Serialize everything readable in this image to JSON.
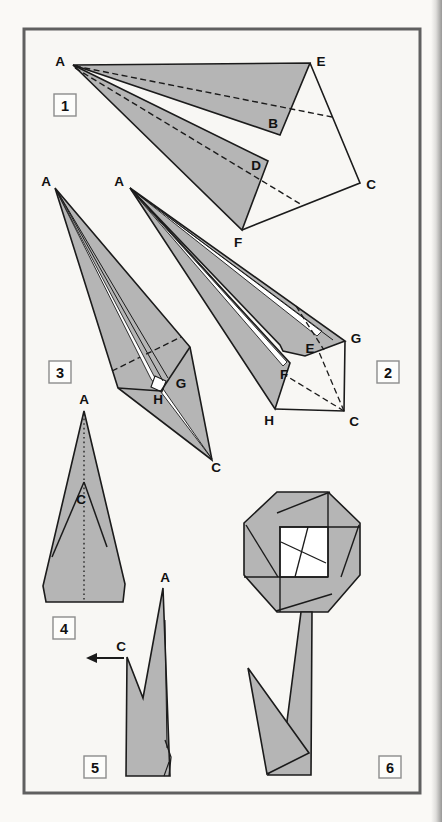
{
  "document": {
    "kind": "origami-instruction-page",
    "subject": "origami flower folding steps"
  },
  "colors": {
    "paper": "#faf9f6",
    "panel": "#f8f7f4",
    "frame": "#606060",
    "fill": "#b5b5b5",
    "line": "#1b1b1b",
    "box_border": "#8c8c8c",
    "box_fill": "#fdfdfb",
    "label": "#111111"
  },
  "frame": {
    "x": 24,
    "y": 29,
    "w": 396,
    "h": 764
  },
  "step_boxes": [
    {
      "n": "1",
      "x": 54,
      "y": 94
    },
    {
      "n": "2",
      "x": 377,
      "y": 361
    },
    {
      "n": "3",
      "x": 49,
      "y": 361
    },
    {
      "n": "4",
      "x": 53,
      "y": 617
    },
    {
      "n": "5",
      "x": 84,
      "y": 756
    },
    {
      "n": "6",
      "x": 379,
      "y": 756
    }
  ],
  "labels": [
    {
      "step": 1,
      "text": "A",
      "x": 60,
      "y": 61
    },
    {
      "step": 1,
      "text": "E",
      "x": 321,
      "y": 61
    },
    {
      "step": 1,
      "text": "B",
      "x": 273,
      "y": 123
    },
    {
      "step": 1,
      "text": "D",
      "x": 256,
      "y": 165
    },
    {
      "step": 1,
      "text": "C",
      "x": 371,
      "y": 184
    },
    {
      "step": 1,
      "text": "F",
      "x": 238,
      "y": 242
    },
    {
      "step": 2,
      "text": "A",
      "x": 119,
      "y": 181
    },
    {
      "step": 2,
      "text": "G",
      "x": 356,
      "y": 338
    },
    {
      "step": 2,
      "text": "E",
      "x": 310,
      "y": 348
    },
    {
      "step": 2,
      "text": "F",
      "x": 284,
      "y": 374
    },
    {
      "step": 2,
      "text": "H",
      "x": 269,
      "y": 420
    },
    {
      "step": 2,
      "text": "C",
      "x": 354,
      "y": 421
    },
    {
      "step": 3,
      "text": "A",
      "x": 46,
      "y": 181
    },
    {
      "step": 3,
      "text": "G",
      "x": 181,
      "y": 383
    },
    {
      "step": 3,
      "text": "H",
      "x": 158,
      "y": 399
    },
    {
      "step": 3,
      "text": "C",
      "x": 216,
      "y": 467
    },
    {
      "step": 4,
      "text": "A",
      "x": 84,
      "y": 399
    },
    {
      "step": 4,
      "text": "C",
      "x": 81,
      "y": 499
    },
    {
      "step": 5,
      "text": "A",
      "x": 165,
      "y": 577
    },
    {
      "step": 5,
      "text": "C",
      "x": 121,
      "y": 646
    }
  ],
  "shapes": [
    {
      "name": "step1-outline",
      "type": "polyline",
      "pts": [
        [
          310,
          63
        ],
        [
          360,
          183
        ],
        [
          242,
          230
        ]
      ],
      "fill": "none"
    },
    {
      "name": "step1-flap-upper",
      "type": "polygon",
      "pts": [
        [
          73,
          65
        ],
        [
          310,
          63
        ],
        [
          280,
          135
        ]
      ],
      "fill": "gray"
    },
    {
      "name": "step1-flap-lower",
      "type": "polygon",
      "pts": [
        [
          73,
          65
        ],
        [
          268,
          161
        ],
        [
          242,
          230
        ]
      ],
      "fill": "gray"
    },
    {
      "name": "step1-foldline-AB",
      "type": "line",
      "pts": [
        [
          75,
          66
        ],
        [
          332,
          117
        ]
      ],
      "dash": "dashed",
      "sw": 1.4
    },
    {
      "name": "step1-foldline-AD",
      "type": "line",
      "pts": [
        [
          75,
          68
        ],
        [
          302,
          205
        ]
      ],
      "dash": "dashed",
      "sw": 1.4
    },
    {
      "name": "step2-outline",
      "type": "polyline",
      "pts": [
        [
          345,
          341
        ],
        [
          344,
          411
        ],
        [
          275,
          409
        ]
      ],
      "fill": "none"
    },
    {
      "name": "step2-foldline-CE",
      "type": "line",
      "pts": [
        [
          344,
          411
        ],
        [
          302,
          312
        ]
      ],
      "dash": "dashed",
      "sw": 1.3
    },
    {
      "name": "step2-foldline-CF",
      "type": "line",
      "pts": [
        [
          344,
          411
        ],
        [
          280,
          372
        ]
      ],
      "dash": "dashed",
      "sw": 1.3
    },
    {
      "name": "step2-spike-upper",
      "type": "polygon",
      "pts": [
        [
          130,
          188
        ],
        [
          345,
          341
        ],
        [
          305,
          356
        ],
        [
          283,
          351
        ],
        [
          280,
          345
        ]
      ],
      "fill": "gray"
    },
    {
      "name": "step2-spike-lower",
      "type": "polygon",
      "pts": [
        [
          130,
          188
        ],
        [
          290,
          363
        ],
        [
          275,
          409
        ]
      ],
      "fill": "gray"
    },
    {
      "name": "step2-slit-upper",
      "type": "polygon",
      "pts": [
        [
          131,
          189
        ],
        [
          322,
          331
        ],
        [
          317,
          336
        ]
      ],
      "fill": "white",
      "sw": 0.9
    },
    {
      "name": "step2-slit-lower",
      "type": "polygon",
      "pts": [
        [
          131,
          190
        ],
        [
          287,
          362
        ],
        [
          283,
          366
        ]
      ],
      "fill": "white",
      "sw": 0.9
    },
    {
      "name": "step2-layer-line",
      "type": "line",
      "pts": [
        [
          131,
          189
        ],
        [
          333,
          340
        ]
      ],
      "sw": 1
    },
    {
      "name": "step2-foldline-E",
      "type": "line",
      "pts": [
        [
          296,
          306
        ],
        [
          324,
          350
        ]
      ],
      "dash": "dashed",
      "sw": 1.3
    },
    {
      "name": "step3-body",
      "type": "polygon",
      "pts": [
        [
          55,
          188
        ],
        [
          190,
          347
        ],
        [
          212,
          460
        ],
        [
          118,
          388
        ]
      ],
      "fill": "gray"
    },
    {
      "name": "step3-foldline",
      "type": "line",
      "pts": [
        [
          112,
          371
        ],
        [
          181,
          337
        ]
      ],
      "dash": "dashed",
      "sw": 1.3
    },
    {
      "name": "step3-slit",
      "type": "polygon",
      "pts": [
        [
          56,
          190
        ],
        [
          154,
          376
        ],
        [
          212,
          459
        ],
        [
          151,
          379
        ]
      ],
      "fill": "white",
      "sw": 0.9
    },
    {
      "name": "step3-pocket",
      "type": "polygon",
      "pts": [
        [
          155,
          376
        ],
        [
          166,
          381
        ],
        [
          162,
          392
        ],
        [
          151,
          387
        ]
      ],
      "fill": "white",
      "sw": 1.1
    },
    {
      "name": "step3-edge-LH",
      "type": "line",
      "pts": [
        [
          118,
          388
        ],
        [
          161,
          391
        ]
      ],
      "sw": 1.5
    },
    {
      "name": "step3-edge-HR",
      "type": "line",
      "pts": [
        [
          161,
          391
        ],
        [
          190,
          347
        ]
      ],
      "sw": 1.5
    },
    {
      "name": "step3-layer-line-1",
      "type": "line",
      "pts": [
        [
          56,
          189
        ],
        [
          163,
          381
        ]
      ],
      "sw": 1
    },
    {
      "name": "step3-layer-line-2",
      "type": "line",
      "pts": [
        [
          56,
          189
        ],
        [
          168,
          378
        ]
      ],
      "sw": 1
    },
    {
      "name": "step4-body",
      "type": "polygon",
      "pts": [
        [
          84,
          411
        ],
        [
          125,
          584
        ],
        [
          123,
          602
        ],
        [
          46,
          602
        ],
        [
          43,
          586
        ]
      ],
      "fill": "gray"
    },
    {
      "name": "step4-centerline",
      "type": "line",
      "pts": [
        [
          84,
          414
        ],
        [
          84,
          601
        ]
      ],
      "dash": "dotted",
      "sw": 1.3
    },
    {
      "name": "step4-fold-left",
      "type": "line",
      "pts": [
        [
          84,
          482
        ],
        [
          52,
          557
        ]
      ],
      "sw": 1.5
    },
    {
      "name": "step4-fold-right",
      "type": "line",
      "pts": [
        [
          84,
          482
        ],
        [
          107,
          547
        ]
      ],
      "sw": 1.5
    },
    {
      "name": "step5-body",
      "type": "polygon",
      "pts": [
        [
          127,
          657
        ],
        [
          126,
          776
        ],
        [
          170,
          776
        ],
        [
          169,
          750
        ],
        [
          163,
          588
        ],
        [
          143,
          698
        ]
      ],
      "fill": "gray"
    },
    {
      "name": "step5-layer-line",
      "type": "line",
      "pts": [
        [
          165,
          620
        ],
        [
          167,
          748
        ]
      ],
      "sw": 1
    },
    {
      "name": "step5-curl",
      "type": "polyline",
      "pts": [
        [
          165,
          740
        ],
        [
          171,
          757
        ],
        [
          169,
          776
        ]
      ],
      "fill": "none",
      "sw": 1.3
    },
    {
      "name": "step5-curl-line",
      "type": "line",
      "pts": [
        [
          169,
          762
        ],
        [
          164,
          776
        ]
      ],
      "sw": 1.1
    },
    {
      "name": "step5-arrow-shaft",
      "type": "line",
      "pts": [
        [
          124,
          658
        ],
        [
          96,
          658
        ]
      ],
      "sw": 2
    },
    {
      "name": "step5-arrow-head",
      "type": "polygon",
      "pts": [
        [
          97,
          653
        ],
        [
          97,
          663
        ],
        [
          86,
          658
        ]
      ],
      "fill": "black",
      "strokeOff": true
    },
    {
      "name": "step6-petals",
      "type": "polygon",
      "pts": [
        [
          277,
          492
        ],
        [
          328,
          492
        ],
        [
          360,
          523
        ],
        [
          360,
          575
        ],
        [
          328,
          612
        ],
        [
          277,
          612
        ],
        [
          244,
          575
        ],
        [
          244,
          523
        ]
      ],
      "fill": "gray"
    },
    {
      "name": "step6-center",
      "type": "polygon",
      "pts": [
        [
          280,
          527
        ],
        [
          328,
          527
        ],
        [
          328,
          577
        ],
        [
          280,
          577
        ]
      ],
      "fill": "white",
      "sw": 1.4
    },
    {
      "name": "step6-edge-top",
      "type": "line",
      "pts": [
        [
          279,
          527
        ],
        [
          360,
          527
        ]
      ],
      "sw": 1.4
    },
    {
      "name": "step6-edge-right",
      "type": "line",
      "pts": [
        [
          328,
          492
        ],
        [
          328,
          577
        ]
      ],
      "sw": 1.4
    },
    {
      "name": "step6-edge-bottom",
      "type": "line",
      "pts": [
        [
          244,
          577
        ],
        [
          328,
          577
        ]
      ],
      "sw": 1.4
    },
    {
      "name": "step6-edge-left",
      "type": "line",
      "pts": [
        [
          280,
          527
        ],
        [
          280,
          612
        ]
      ],
      "sw": 1.4
    },
    {
      "name": "step6-petal-line-1",
      "type": "line",
      "pts": [
        [
          277,
          513
        ],
        [
          330,
          492
        ]
      ],
      "sw": 1.4
    },
    {
      "name": "step6-petal-line-2",
      "type": "line",
      "pts": [
        [
          359,
          525
        ],
        [
          341,
          577
        ]
      ],
      "sw": 1.4
    },
    {
      "name": "step6-petal-line-3",
      "type": "line",
      "pts": [
        [
          246,
          525
        ],
        [
          278,
          577
        ]
      ],
      "sw": 1.4
    },
    {
      "name": "step6-petal-line-4",
      "type": "line",
      "pts": [
        [
          276,
          611
        ],
        [
          332,
          594
        ]
      ],
      "sw": 1.4
    },
    {
      "name": "step6-center-line-1",
      "type": "line",
      "pts": [
        [
          281,
          542
        ],
        [
          326,
          563
        ]
      ],
      "sw": 1.3
    },
    {
      "name": "step6-center-line-2",
      "type": "line",
      "pts": [
        [
          308,
          527
        ],
        [
          295,
          577
        ]
      ],
      "sw": 1.3
    },
    {
      "name": "step6-stem",
      "type": "polygon",
      "pts": [
        [
          301,
          612
        ],
        [
          312,
          612
        ],
        [
          311,
          775
        ],
        [
          268,
          775
        ],
        [
          286,
          729
        ]
      ],
      "fill": "gray"
    },
    {
      "name": "step6-leaf",
      "type": "polygon",
      "pts": [
        [
          248,
          668
        ],
        [
          309,
          753
        ],
        [
          267,
          774
        ]
      ],
      "fill": "gray"
    }
  ]
}
